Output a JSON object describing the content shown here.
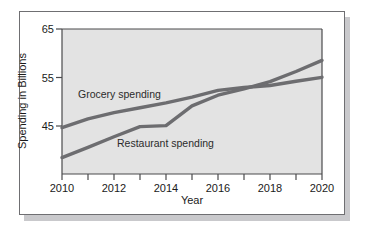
{
  "figure": {
    "plot_background": "#e3e3e3",
    "line_color": "#6d6d70",
    "frame_color": "#6f6f72"
  },
  "chart_data": {
    "type": "line",
    "title": "",
    "xlabel": "Year",
    "ylabel": "Spending in Billions",
    "xlim": [
      2010,
      2020
    ],
    "ylim": [
      35,
      65
    ],
    "grid": false,
    "legend_position": "inline-annotation",
    "xticks": [
      2010,
      2012,
      2014,
      2016,
      2018,
      2020
    ],
    "xtick_labels": [
      "2010",
      "2012",
      "2014",
      "2016",
      "2018",
      "2020"
    ],
    "xminor_ticks": [
      2011,
      2013,
      2015,
      2017,
      2019
    ],
    "yticks": [
      45,
      55,
      65
    ],
    "ytick_labels": [
      "45",
      "55",
      "65"
    ],
    "x": [
      2010,
      2011,
      2012,
      2013,
      2014,
      2015,
      2016,
      2017,
      2018,
      2019,
      2020
    ],
    "series": [
      {
        "name": "Grocery spending",
        "label_text": "Grocery spending",
        "values": [
          44.6,
          46.4,
          47.7,
          48.7,
          49.7,
          50.9,
          52.3,
          52.9,
          53.3,
          54.2,
          55.0
        ]
      },
      {
        "name": "Restaurant spending",
        "label_text": "Restaurant spending",
        "values": [
          38.4,
          40.5,
          42.7,
          44.8,
          45.0,
          49.1,
          51.3,
          52.6,
          54.1,
          56.2,
          58.5
        ]
      }
    ],
    "annotations": [
      {
        "text": "Grocery spending",
        "x": 2011.0,
        "y": 57.0
      },
      {
        "text": "Restaurant spending",
        "x": 2012.6,
        "y": 46.3
      }
    ]
  }
}
